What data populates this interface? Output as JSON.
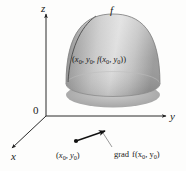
{
  "figure": {
    "background_color": "#fdfdfc",
    "ink_color": "#1a1a1a"
  },
  "axes": {
    "z_label": "z",
    "y_label": "y",
    "x_label": "x",
    "origin_label": "0"
  },
  "surface": {
    "function_label": "f",
    "shape": "paraboloid-dome",
    "fill_light": "#e8e8e8",
    "fill_mid": "#b4b4b4",
    "fill_dark": "#7d7d7d",
    "rim_dark": "#6f6f6f"
  },
  "surface_point": {
    "open_paren": "(",
    "x0": "x",
    "x0_sub": "0",
    "comma1": ", ",
    "y0": "y",
    "y0_sub": "0",
    "comma2": ", ",
    "f": "f",
    "inner_open": "(",
    "fx0": "x",
    "fx0_sub": "0",
    "comma3": ", ",
    "fy0": "y",
    "fy0_sub": "0",
    "inner_close": ")",
    "close_paren": ")",
    "full_text": "(x0, y0, f(x0, y0))"
  },
  "base_point": {
    "open_paren": "(",
    "x0": "x",
    "x0_sub": "0",
    "comma": ", ",
    "y0": "y",
    "y0_sub": "0",
    "close_paren": ")",
    "full_text": "(x0, y0)"
  },
  "gradient": {
    "word": "grad",
    "f": "f",
    "open_paren": "(",
    "x0": "x",
    "x0_sub": "0",
    "comma": ", ",
    "y0": "y",
    "y0_sub": "0",
    "close_paren": ")",
    "full_text": "grad f(x0, y0)"
  }
}
